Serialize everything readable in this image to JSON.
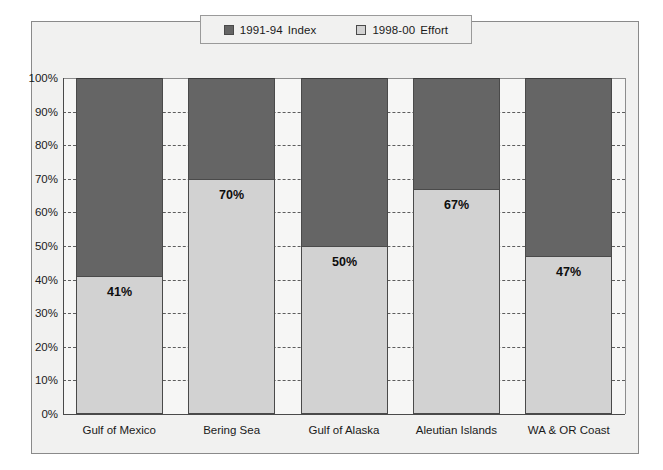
{
  "chart_data": {
    "type": "bar",
    "subtype": "stacked-100-percent",
    "title": "",
    "xlabel": "",
    "ylabel": "",
    "ylim": [
      0,
      100
    ],
    "ytick_labels": [
      "100%",
      "90%",
      "80%",
      "70%",
      "60%",
      "50%",
      "40%",
      "30%",
      "20%",
      "10%",
      "0%"
    ],
    "ytick_values": [
      100,
      90,
      80,
      70,
      60,
      50,
      40,
      30,
      20,
      10,
      0
    ],
    "grid": "horizontal-dashed",
    "legend_position": "top-center",
    "categories": [
      "Gulf of Mexico",
      "Bering Sea",
      "Gulf of Alaska",
      "Aleutian Islands",
      "WA & OR Coast"
    ],
    "series": [
      {
        "name": "1998-00  Effort",
        "color": "#d2d2d2",
        "values": [
          41,
          70,
          50,
          67,
          47
        ],
        "labels": [
          "41%",
          "70%",
          "50%",
          "67%",
          "47%"
        ]
      },
      {
        "name": "1991-94  Index",
        "color": "#656565",
        "values": [
          59,
          30,
          50,
          33,
          53
        ],
        "labels": [
          "",
          "",
          "",
          "",
          ""
        ]
      }
    ]
  },
  "legend": {
    "entries": [
      {
        "swatch": "dark",
        "period": "1991-94",
        "name": "Index"
      },
      {
        "swatch": "light",
        "period": "1998-00",
        "name": "Effort"
      }
    ]
  },
  "colors": {
    "dark_gray": "#656565",
    "light_gray": "#d2d2d2",
    "frame_background": "#f1f1f0",
    "plot_background": "#f6f6f5",
    "axis": "#4a4a4a"
  }
}
